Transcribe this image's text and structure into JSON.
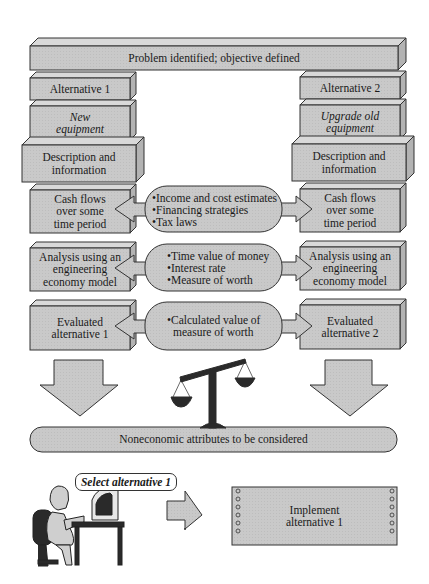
{
  "diagram": {
    "title": "Problem identified; objective defined",
    "left_column": {
      "alternative": "Alternative 1",
      "option": "New\nequipment",
      "description": "Description and\ninformation",
      "cash_flows": "Cash flows\nover some\ntime period",
      "analysis": "Analysis using an\nengineering\neconomy model",
      "evaluated": "Evaluated\nalternative 1"
    },
    "right_column": {
      "alternative": "Alternative 2",
      "option": "Upgrade old\nequipment",
      "description": "Description and\ninformation",
      "cash_flows": "Cash flows\nover some\ntime period",
      "analysis": "Analysis using an\nengineering\neconomy model",
      "evaluated": "Evaluated\nalternative 2"
    },
    "center_ovals": [
      {
        "bullets": [
          "Income and cost estimates",
          "Financing strategies",
          "Tax laws"
        ]
      },
      {
        "bullets": [
          "Time value of money",
          "Interest rate",
          "Measure of worth"
        ]
      },
      {
        "bullets": [
          "Calculated value of",
          "measure of worth"
        ]
      }
    ],
    "noneconomic": "Noneconomic attributes to be considered",
    "speech_bubble": "Select alternative 1",
    "implement": "Implement\nalternative 1",
    "icons": [
      "balance-scale-icon",
      "person-at-computer-icon",
      "down-arrow-icon",
      "right-arrow-icon"
    ],
    "colors": {
      "box_fill": "#c8c8c8",
      "box_top": "#d8d8d8",
      "box_side": "#b4b4b4",
      "stroke": "#333333",
      "scale": "#2a2a2a"
    }
  }
}
